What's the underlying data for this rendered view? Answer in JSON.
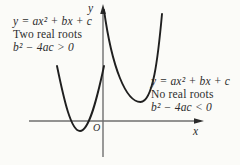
{
  "colors": {
    "background": "#fbfbf8",
    "curve": "#1f1f1f",
    "axis": "#6f6f6f",
    "arrow": "#2a2a2a",
    "text": "#2d2d2d"
  },
  "axes": {
    "y_label": "y",
    "x_label": "x",
    "origin_label": "O"
  },
  "curves": {
    "two_roots_path": "M 57 66 C 64 100 71 131 80 131 C 89 131 97 99 104 66",
    "no_roots_path": "M 104 10 C 112 68 126 102 140.5 102 C 153 102 158 58 162 14"
  },
  "annotations": {
    "two_real_roots": {
      "equation": "y = ax² + bx + c",
      "description": "Two real roots",
      "discriminant": "b² − 4ac > 0"
    },
    "no_real_roots": {
      "equation": "y = ax² + bx + c",
      "description": "No real roots",
      "discriminant": "b² − 4ac < 0"
    }
  }
}
